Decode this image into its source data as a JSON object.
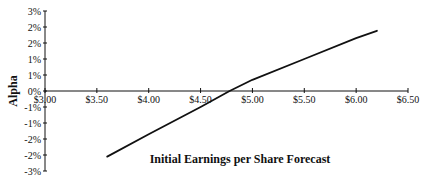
{
  "chart_data": {
    "type": "line",
    "title": "",
    "xlabel": "Initial Earnings per Share Forecast",
    "ylabel": "Alpha",
    "xlim": [
      3.0,
      6.5
    ],
    "ylim": [
      -2.5,
      2.5
    ],
    "grid": false,
    "legend": null,
    "x_ticks": [
      "$3.00",
      "$3.50",
      "$4.00",
      "$4.50",
      "$5.00",
      "$5.50",
      "$6.00",
      "$6.50"
    ],
    "x_tick_values": [
      3.0,
      3.5,
      4.0,
      4.5,
      5.0,
      5.5,
      6.0,
      6.5
    ],
    "y_ticks": [
      "3%",
      "2%",
      "2%",
      "1%",
      "1%",
      "0%",
      "-1%",
      "-1%",
      "-2%",
      "-2%",
      "-3%"
    ],
    "y_tick_values": [
      2.5,
      2.0,
      1.5,
      1.0,
      0.5,
      0.0,
      -0.5,
      -1.0,
      -1.5,
      -2.0,
      -2.5
    ],
    "series": [
      {
        "name": "Alpha",
        "color": "#111111",
        "x": [
          3.6,
          4.0,
          4.5,
          4.78,
          5.0,
          5.5,
          6.0,
          6.2
        ],
        "y": [
          -2.05,
          -1.35,
          -0.5,
          0.0,
          0.35,
          1.0,
          1.65,
          1.88
        ]
      }
    ]
  },
  "colors": {
    "line": "#111111",
    "axis": "#111111",
    "background": "#ffffff"
  }
}
